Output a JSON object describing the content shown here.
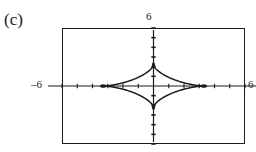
{
  "figure": {
    "part_label": "(c)",
    "clipped_caption_text": "",
    "frame": {
      "left": 62,
      "top": 28,
      "width": 183,
      "height": 116
    }
  },
  "labels": {
    "top": "6",
    "left": "–6",
    "right": "6"
  },
  "colors": {
    "ink": "#1c1c1c",
    "background": "#ffffff",
    "faint": "#b9b9b9"
  },
  "chart_data": {
    "type": "line",
    "title": "(c)",
    "xlabel": "",
    "ylabel": "",
    "xlim": [
      -6,
      6
    ],
    "ylim": [
      -6,
      6
    ],
    "xticks": [
      -6,
      -5,
      -4,
      -3,
      -2,
      -1,
      0,
      1,
      2,
      3,
      4,
      5,
      6
    ],
    "yticks": [
      -6,
      -5,
      -4,
      -3,
      -2,
      -1,
      0,
      1,
      2,
      3,
      4,
      5,
      6
    ],
    "tick_labels_shown": [
      "6",
      "–6",
      "6"
    ],
    "grid": false,
    "legend": null,
    "axes_style": "graphing-calculator crosshair axes with unit tick marks",
    "series": [
      {
        "name": "astroid",
        "equation": "(x/3.3)^(2/3) + (y/2.2)^(2/3) = 1",
        "cusps": [
          {
            "x": -3.3,
            "y": 0
          },
          {
            "x": 0,
            "y": 2.2
          },
          {
            "x": 3.3,
            "y": 0
          },
          {
            "x": 0,
            "y": -2.2
          }
        ],
        "x_extent": [
          -3.3,
          3.3
        ],
        "y_extent": [
          -2.2,
          2.2
        ],
        "shape": "four-cusped star (astroid) with concave sides, wider than tall"
      }
    ]
  }
}
